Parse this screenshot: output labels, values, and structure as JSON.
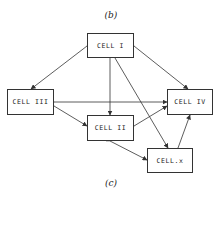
{
  "captions": {
    "top": "(b)",
    "bottom": "(c)"
  },
  "nodes": [
    {
      "id": "cell-1",
      "label": "CELL I"
    },
    {
      "id": "cell-3",
      "label": "CELL III"
    },
    {
      "id": "cell-4",
      "label": "CELL IV"
    },
    {
      "id": "cell-2",
      "label": "CELL II"
    },
    {
      "id": "cell-x",
      "label": "CELL.x"
    }
  ],
  "edges": [
    {
      "from": "CELL I",
      "to": "CELL III",
      "direction": "both"
    },
    {
      "from": "CELL I",
      "to": "CELL IV",
      "direction": "both"
    },
    {
      "from": "CELL I",
      "to": "CELL II",
      "direction": "forward"
    },
    {
      "from": "CELL I",
      "to": "CELL.x",
      "direction": "forward"
    },
    {
      "from": "CELL III",
      "to": "CELL IV",
      "direction": "both"
    },
    {
      "from": "CELL III",
      "to": "CELL II",
      "direction": "both"
    },
    {
      "from": "CELL II",
      "to": "CELL IV",
      "direction": "both"
    },
    {
      "from": "CELL II",
      "to": "CELL.x",
      "direction": "both"
    },
    {
      "from": "CELL.x",
      "to": "CELL IV",
      "direction": "both"
    }
  ],
  "colors": {
    "line": "#333333",
    "background": "#ffffff"
  }
}
